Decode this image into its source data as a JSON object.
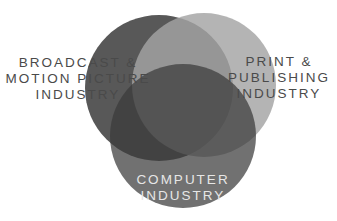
{
  "diagram": {
    "type": "venn",
    "sets": [
      {
        "id": "broadcast",
        "label_lines": [
          "BROADCAST &",
          "MOTION PICTURE",
          "INDUSTRY"
        ],
        "color": "#585858"
      },
      {
        "id": "print",
        "label_lines": [
          "PRINT &",
          "PUBLISHING",
          "INDUSTRY"
        ],
        "color": "#a4a4a4"
      },
      {
        "id": "computer",
        "label_lines": [
          "COMPUTER",
          "INDUSTRY"
        ],
        "color": "#3a3a3a"
      }
    ],
    "colors": {
      "background": "#ffffff",
      "label_outside": "#4a4a4a",
      "label_inside": "#e6e6e6"
    }
  }
}
